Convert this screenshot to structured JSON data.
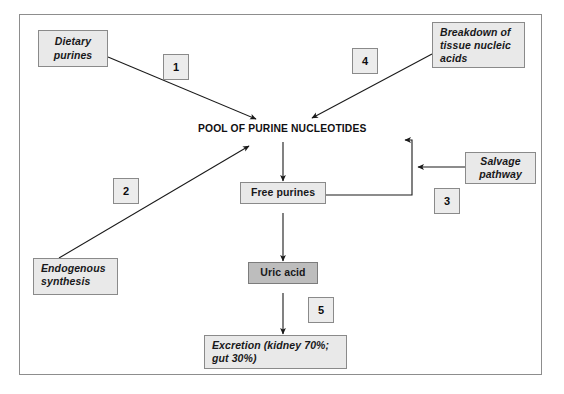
{
  "diagram": {
    "title_text": "POOL OF PURINE NUCLEOTIDES",
    "nodes": {
      "dietary_purines": "Dietary\npurines",
      "breakdown_tissue": "Breakdown of\ntissue nucleic\nacids",
      "salvage_pathway": "Salvage\npathway",
      "endogenous_synthesis": "Endogenous\nsynthesis",
      "free_purines": "Free purines",
      "uric_acid": "Uric acid",
      "excretion": "Excretion (kidney 70%;\ngut 30%)"
    },
    "step_labels": {
      "one": "1",
      "two": "2",
      "three": "3",
      "four": "4",
      "five": "5"
    },
    "colors": {
      "frame_border": "#8d8d8d",
      "node_fill": "#e9e9e9",
      "node_fill_dark": "#bdbdbd",
      "node_border": "#8a8a8a",
      "arrow": "#1a1a1a",
      "text": "#18181a",
      "background": "#ffffff"
    }
  }
}
